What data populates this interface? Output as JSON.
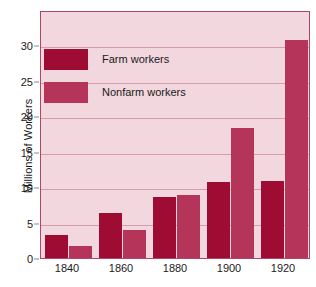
{
  "chart_data": {
    "type": "bar",
    "title": "",
    "xlabel": "",
    "ylabel": "Millions of Workers",
    "categories": [
      "1840",
      "1860",
      "1880",
      "1900",
      "1920"
    ],
    "series": [
      {
        "name": "Farm workers",
        "color": "#9e0b33",
        "values": [
          3.2,
          6.4,
          8.6,
          10.7,
          10.9
        ]
      },
      {
        "name": "Nonfarm workers",
        "color": "#b5355a",
        "values": [
          1.7,
          3.9,
          8.9,
          18.3,
          30.8
        ]
      }
    ],
    "ylim": [
      0,
      35
    ],
    "yticks": [
      0,
      5,
      10,
      15,
      20,
      25,
      30
    ],
    "ytick_labels": [
      "0",
      "5",
      "10",
      "15",
      "20",
      "25",
      "30"
    ],
    "grid": true,
    "legend_position": "upper-left",
    "plot_background": "#f2d7df",
    "gridline_color": "#d79aae",
    "frame_color": "#b0456a"
  }
}
